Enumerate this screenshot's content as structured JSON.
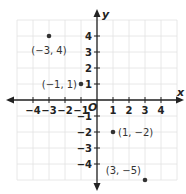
{
  "chart_data": {
    "type": "scatter",
    "title": "",
    "xlabel": "x",
    "ylabel": "y",
    "origin_label": "O",
    "xlim": [
      -5,
      5
    ],
    "ylim": [
      -5,
      5
    ],
    "grid": true,
    "x_ticks": [
      -4,
      -3,
      -2,
      -1,
      1,
      2,
      3,
      4
    ],
    "y_ticks": [
      4,
      3,
      2,
      1,
      -1,
      -2,
      -3,
      -4
    ],
    "x_tick_labels": [
      "−4",
      "−3",
      "−2",
      "−1",
      "1",
      "2",
      "3",
      "4"
    ],
    "y_tick_labels": [
      "4",
      "3",
      "2",
      "1",
      "−1",
      "−2",
      "−3",
      "−4"
    ],
    "points": [
      {
        "x": -3,
        "y": 4,
        "label": "(−3, 4)"
      },
      {
        "x": -1,
        "y": 1,
        "label": "(−1, 1)"
      },
      {
        "x": 1,
        "y": -2,
        "label": "(1, −2)"
      },
      {
        "x": 3,
        "y": -5,
        "label": "(3, −5)"
      }
    ]
  },
  "colors": {
    "grid": "#e2e2e2",
    "axis": "#222222",
    "point": "#333333"
  }
}
